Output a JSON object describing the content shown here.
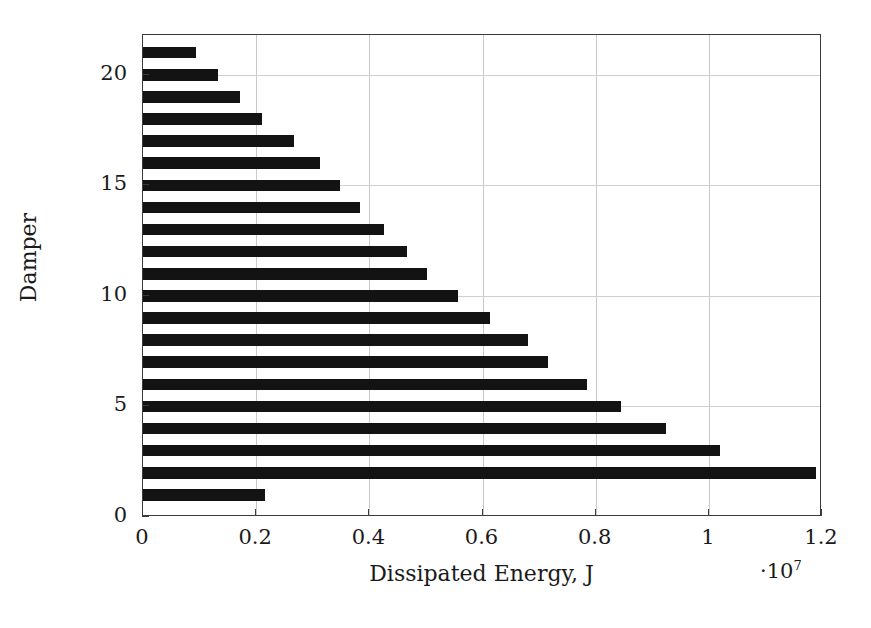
{
  "chart_data": {
    "type": "bar",
    "orientation": "horizontal",
    "title": "",
    "subtitle": "",
    "xlabel": "Dissipated Energy, J",
    "ylabel": "Damper",
    "x_multiplier": "·10",
    "x_multiplier_exponent": "7",
    "xlim": [
      0,
      1.2
    ],
    "ylim": [
      0,
      21.8
    ],
    "xticks": [
      0,
      0.2,
      0.4,
      0.6,
      0.8,
      1,
      1.2
    ],
    "xticklabels": [
      "0",
      "0.2",
      "0.4",
      "0.6",
      "0.8",
      "1",
      "1.2"
    ],
    "yticks": [
      0,
      5,
      10,
      15,
      20
    ],
    "yticklabels": [
      "0",
      "5",
      "10",
      "15",
      "20"
    ],
    "grid": true,
    "grid_axes": "both",
    "bar_color": "#131313",
    "categories": [
      1,
      2,
      3,
      4,
      5,
      6,
      7,
      8,
      9,
      10,
      11,
      12,
      13,
      14,
      15,
      16,
      17,
      18,
      19,
      20,
      21
    ],
    "values": [
      0.215,
      1.19,
      1.02,
      0.925,
      0.845,
      0.784,
      0.715,
      0.68,
      0.614,
      0.557,
      0.502,
      0.467,
      0.426,
      0.383,
      0.348,
      0.313,
      0.267,
      0.21,
      0.171,
      0.132,
      0.093
    ],
    "value_units": "1e7 J",
    "legend": null,
    "annotations": []
  },
  "axes": {
    "x_title": "Dissipated Energy, J",
    "y_title": "Damper"
  }
}
